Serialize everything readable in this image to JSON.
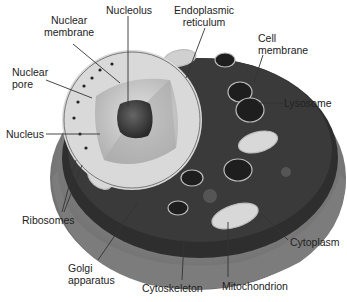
{
  "diagram": {
    "labels": {
      "nucleolus": "Nucleolus",
      "nuclear_membrane": [
        "Nuclear",
        "membrane"
      ],
      "nuclear_pore": [
        "Nuclear",
        "pore"
      ],
      "endoplasmic_reticulum": [
        "Endoplasmic",
        "reticulum"
      ],
      "cell_membrane": [
        "Cell",
        "membrane"
      ],
      "lysosome": "Lysosome",
      "nucleus": "Nucleus",
      "ribosomes": "Ribosomes",
      "golgi_apparatus": [
        "Golgi",
        "apparatus"
      ],
      "cytoskeleton": "Cytoskeleton",
      "mitochondrion": "Mitochondrion",
      "cytoplasm": "Cytoplasm"
    },
    "colors": {
      "background": "#ffffff",
      "outer_shell": "#8a8a8a",
      "shell_dark": "#5a5a5a",
      "interior": "#2a2a2a",
      "nucleus_light": "#c8c8c8",
      "nucleolus": "#3a3a3a",
      "leader_line": "#333333",
      "text": "#222222"
    }
  }
}
